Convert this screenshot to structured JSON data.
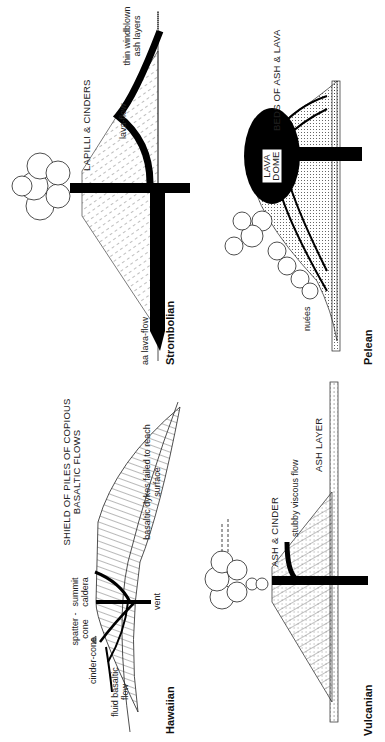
{
  "diagram": {
    "orientation": "rotated 90 degrees counter-clockwise",
    "panels": [
      {
        "id": "hawaiian",
        "title": "Hawaiian",
        "labels": {
          "fluid_basaltic_flow": "fluid basaltic flow",
          "cinder_cone": "cinder-cone",
          "spatter_cone": "spatter -cone",
          "summit_caldera": "summit caldera",
          "vent": "vent",
          "shield": "SHIELD OF PILES OF COPIOUS BASALTIC FLOWS",
          "basaltic_dykes": "basaltic dykes failed to reach surface"
        }
      },
      {
        "id": "strombolian",
        "title": "Strombolian",
        "labels": {
          "aa_lava_flow": "aa lava-flow",
          "lapilli_cinders": "LAPILLI & CINDERS",
          "lava_flow": "lava-flow",
          "windblown_ash": "thin windblown ash layers"
        }
      },
      {
        "id": "vulcanian",
        "title": "Vulcanian",
        "labels": {
          "ash_cinder": "ASH & CINDER",
          "stubby_viscous_flow": "stubby viscous flow",
          "ash_layer": "ASH LAYER"
        }
      },
      {
        "id": "pelean",
        "title": "Pelean",
        "labels": {
          "nuees": "nuées",
          "lava_dome": "LAVA DOME",
          "beds_ash_lava": "BEDS OF ASH & LAVA"
        }
      }
    ]
  }
}
